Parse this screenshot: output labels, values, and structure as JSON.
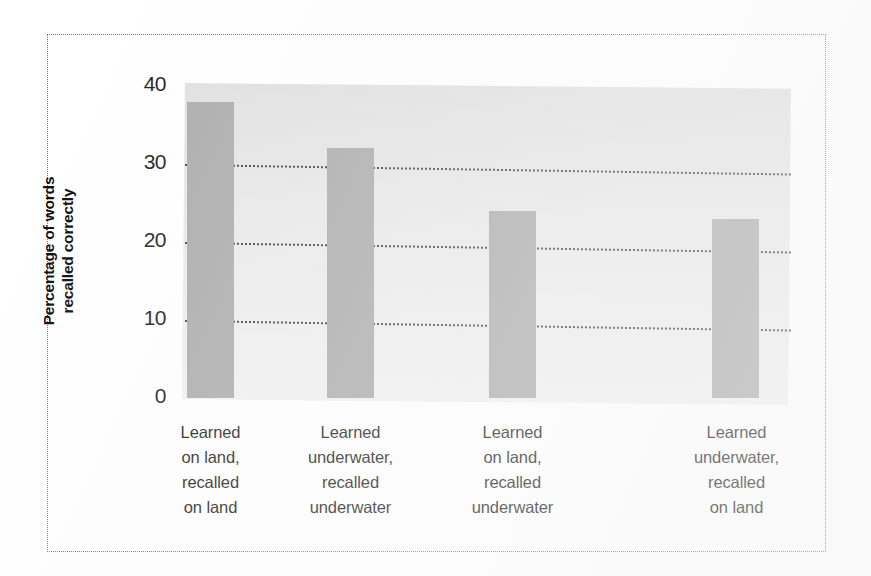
{
  "chart_data": {
    "type": "bar",
    "title": "",
    "subtitle": "",
    "xlabel": "",
    "ylabel": "Percentage of words recalled correctly",
    "ylabel_lines": [
      "Percentage of words",
      "recalled correctly"
    ],
    "categories": [
      "Learned on land, recalled on land",
      "Learned underwater, recalled underwater",
      "Learned on land, recalled underwater",
      "Learned underwater, recalled on land"
    ],
    "category_lines": [
      [
        "Learned",
        "on land,",
        "recalled",
        "on land"
      ],
      [
        "Learned",
        "underwater,",
        "recalled",
        "underwater"
      ],
      [
        "Learned",
        "on land,",
        "recalled",
        "underwater"
      ],
      [
        "Learned",
        "underwater,",
        "recalled",
        "on land"
      ]
    ],
    "values": [
      38,
      32,
      24,
      23
    ],
    "ylim": [
      0,
      40
    ],
    "yticks": [
      0,
      10,
      20,
      30,
      40
    ],
    "ytick_labels": [
      "0",
      "10",
      "20",
      "30",
      "40"
    ],
    "gridlines_at": [
      10,
      20,
      30
    ],
    "grid": true,
    "legend": "none",
    "bar_color": "#a8a8a8",
    "plot_background_color": "#dddddd",
    "gridline_color": "#3b3b3b",
    "frame_color": "#6f6f6f",
    "text_color": "#111111"
  }
}
